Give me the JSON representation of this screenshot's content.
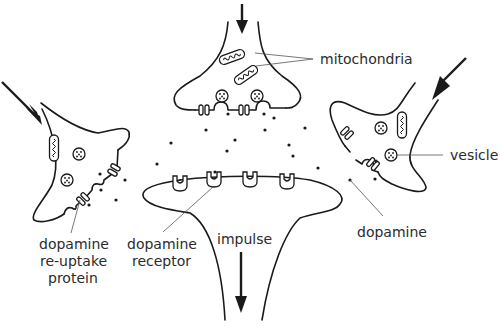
{
  "diagram": {
    "colors": {
      "line": "#1a1a1a",
      "leader": "#555555",
      "text": "#2b2b2b",
      "background": "#ffffff"
    },
    "labels": {
      "mitochondria": "mitochondria",
      "vesicle": "vesicle",
      "dopamine": "dopamine",
      "impulse": "impulse",
      "receptor_line1": "dopamine",
      "receptor_line2": "receptor",
      "reuptake_line1": "dopamine",
      "reuptake_line2": "re-uptake",
      "reuptake_line3": "protein"
    },
    "components": [
      {
        "name": "presynaptic-terminal-top",
        "arrow": "incoming impulse"
      },
      {
        "name": "presynaptic-terminal-left",
        "arrow": "incoming impulse"
      },
      {
        "name": "presynaptic-terminal-right",
        "arrow": "incoming impulse"
      },
      {
        "name": "postsynaptic-neuron",
        "arrow": "outgoing impulse",
        "receptor_count": 4
      }
    ],
    "icons": [
      "arrow-down-icon",
      "mitochondrion-icon",
      "vesicle-icon",
      "dopamine-dot-icon",
      "receptor-icon",
      "reuptake-protein-icon"
    ]
  }
}
